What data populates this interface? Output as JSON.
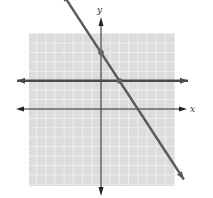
{
  "chart_data": {
    "type": "line",
    "title": "",
    "xlabel": "x",
    "ylabel": "y",
    "xlim": [
      -8,
      8
    ],
    "ylim": [
      -8.5,
      8
    ],
    "grid": true,
    "legend": null,
    "series": [
      {
        "name": "horizontal line",
        "equation": "y = 3",
        "slope": 0,
        "intercept": 3,
        "color": "#4a4a4a"
      },
      {
        "name": "decreasing line",
        "equation": "y = -1.5x + 6",
        "slope": -1.5,
        "intercept": 6,
        "color": "#5a5a5a"
      }
    ],
    "points": [
      {
        "label": "y-intercept",
        "x": 0,
        "y": 6
      },
      {
        "label": "intersection",
        "x": 2,
        "y": 3
      }
    ],
    "annotations": []
  },
  "labels": {
    "x_axis": "x",
    "y_axis": "y"
  },
  "colors": {
    "grid_background": "#dcdcdc",
    "grid_line": "#f2f2f2",
    "axis": "#222222",
    "line": "#555555",
    "point": "#666666"
  }
}
